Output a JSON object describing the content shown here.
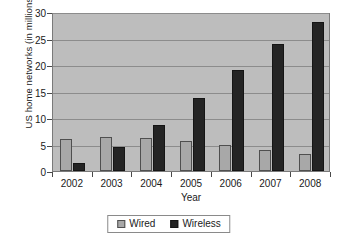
{
  "chart_data": {
    "type": "bar",
    "title": "",
    "subtitle": "",
    "xlabel": "Year",
    "ylabel": "US home networks (in millions)",
    "categories": [
      "2002",
      "2003",
      "2004",
      "2005",
      "2006",
      "2007",
      "2008"
    ],
    "series": [
      {
        "name": "Wired",
        "color": "#a8a8a8",
        "values": [
          6.0,
          6.5,
          6.2,
          5.6,
          4.9,
          3.9,
          3.3
        ]
      },
      {
        "name": "Wireless",
        "color": "#242424",
        "values": [
          1.6,
          4.5,
          8.7,
          13.7,
          19.1,
          24.0,
          28.1
        ]
      }
    ],
    "ylim": [
      0,
      30
    ],
    "ytick_step": 5,
    "yticks": [
      0,
      5,
      10,
      15,
      20,
      25,
      30
    ],
    "ytick_labels": [
      "0",
      "5",
      "10",
      "15",
      "20",
      "25",
      "30"
    ],
    "grid": true,
    "grid_axis": "y",
    "legend_position": "bottom",
    "plot_background": "#bdbdbd",
    "page_background": "#ffffff",
    "axis_color": "#4a4a4a",
    "gridline_color": "#8c8c8c",
    "text_color": "#1a1a1a"
  },
  "legend": {
    "entries": [
      {
        "label": "Wired",
        "swatch_name": "legend-swatch-wired"
      },
      {
        "label": "Wireless",
        "swatch_name": "legend-swatch-wireless"
      }
    ]
  }
}
